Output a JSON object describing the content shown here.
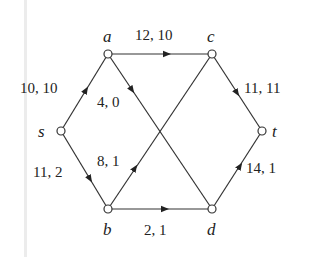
{
  "diagram": {
    "type": "flow-network",
    "colors": {
      "edge": "#333333",
      "text": "#222222",
      "background": "#ffffff"
    },
    "nodes": [
      {
        "id": "s",
        "label": "s",
        "x": 61,
        "y": 131
      },
      {
        "id": "a",
        "label": "a",
        "x": 108,
        "y": 54
      },
      {
        "id": "c",
        "label": "c",
        "x": 212,
        "y": 54
      },
      {
        "id": "t",
        "label": "t",
        "x": 262,
        "y": 131
      },
      {
        "id": "b",
        "label": "b",
        "x": 108,
        "y": 209
      },
      {
        "id": "d",
        "label": "d",
        "x": 212,
        "y": 209
      }
    ],
    "edges": [
      {
        "from": "s",
        "to": "a",
        "capacity": 10,
        "flow": 10,
        "label": "10, 10"
      },
      {
        "from": "s",
        "to": "b",
        "capacity": 11,
        "flow": 2,
        "label": "11, 2"
      },
      {
        "from": "a",
        "to": "c",
        "capacity": 12,
        "flow": 10,
        "label": "12, 10"
      },
      {
        "from": "a",
        "to": "d",
        "capacity": 4,
        "flow": 0,
        "label": "4, 0"
      },
      {
        "from": "b",
        "to": "c",
        "capacity": 8,
        "flow": 1,
        "label": "8, 1"
      },
      {
        "from": "b",
        "to": "d",
        "capacity": 2,
        "flow": 1,
        "label": "2, 1"
      },
      {
        "from": "c",
        "to": "t",
        "capacity": 11,
        "flow": 11,
        "label": "11, 11"
      },
      {
        "from": "d",
        "to": "t",
        "capacity": 14,
        "flow": 1,
        "label": "14, 1"
      }
    ]
  }
}
